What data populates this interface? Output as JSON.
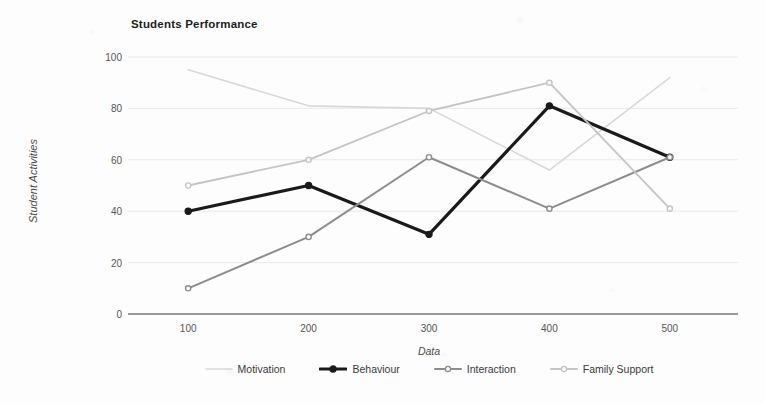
{
  "chart_data": {
    "type": "line",
    "title": "Students Performance",
    "xlabel": "Data",
    "ylabel": "Student Activities",
    "x": [
      100,
      200,
      300,
      400,
      500
    ],
    "xtick_labels": [
      "100",
      "200",
      "300",
      "400",
      "500"
    ],
    "ytick_labels": [
      "0",
      "20",
      "40",
      "60",
      "80",
      "100"
    ],
    "yticks": [
      0,
      20,
      40,
      60,
      80,
      100
    ],
    "ylim": [
      0,
      100
    ],
    "grid": true,
    "legend_position": "bottom",
    "series": [
      {
        "name": "Motivation",
        "values": [
          95,
          81,
          80,
          56,
          92
        ],
        "color": "#d8d8d8",
        "width": 1.6,
        "marker": "none"
      },
      {
        "name": "Behaviour",
        "values": [
          40,
          50,
          31,
          81,
          61
        ],
        "color": "#1a1a1a",
        "width": 3.2,
        "marker": "dot"
      },
      {
        "name": "Interaction",
        "values": [
          10,
          30,
          61,
          41,
          61
        ],
        "color": "#8d8d8d",
        "width": 2.0,
        "marker": "circle"
      },
      {
        "name": "Family Support",
        "values": [
          50,
          60,
          79,
          90,
          41
        ],
        "color": "#c4c4c4",
        "width": 1.8,
        "marker": "circle"
      }
    ]
  }
}
